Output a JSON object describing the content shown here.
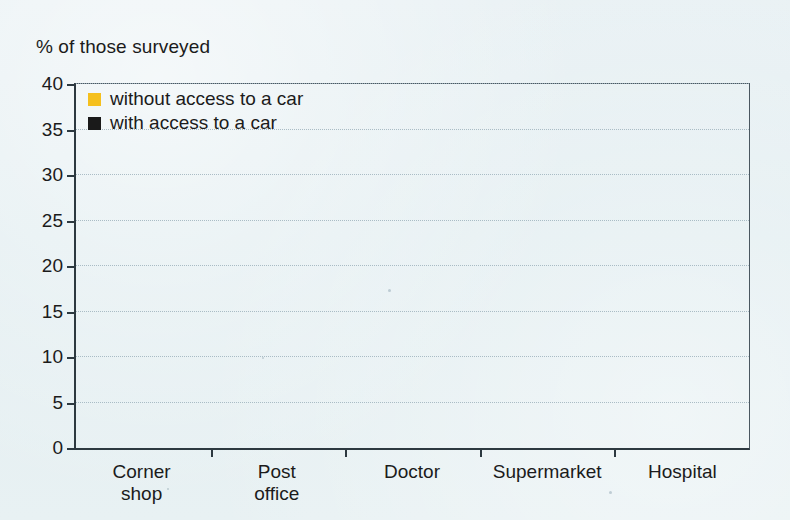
{
  "chart_data": {
    "type": "bar",
    "title": "",
    "ylabel": "% of those surveyed",
    "xlabel": "",
    "ylim": [
      0,
      40
    ],
    "yticks": [
      0,
      5,
      10,
      15,
      20,
      25,
      30,
      35,
      40
    ],
    "grid": true,
    "legend_position": "top-left",
    "categories": [
      "Corner shop",
      "Post office",
      "Doctor",
      "Supermarket",
      "Hospital"
    ],
    "category_lines": [
      [
        "Corner",
        "shop"
      ],
      [
        "Post",
        "office"
      ],
      [
        "Doctor"
      ],
      [
        "Supermarket"
      ],
      [
        "Hospital"
      ]
    ],
    "series": [
      {
        "name": "with access to a car",
        "color": "#262626",
        "values": [
          2.9,
          2.9,
          3.9,
          2.8,
          16.7
        ]
      },
      {
        "name": "without access to a car",
        "color": "#f5c01e",
        "values": [
          8.8,
          9.9,
          15.8,
          16.7,
          37.8
        ]
      }
    ]
  },
  "legend": {
    "entries": [
      {
        "label": "without access to a car",
        "swatch": "light"
      },
      {
        "label": "with access to a car",
        "swatch": "dark"
      }
    ]
  },
  "colors": {
    "bar_light": "#f5c01e",
    "bar_dark": "#262626",
    "background": "#e7f0f3",
    "axis": "#2d3940",
    "gridline": "#9fb3bd",
    "text": "#1b1b1b"
  }
}
